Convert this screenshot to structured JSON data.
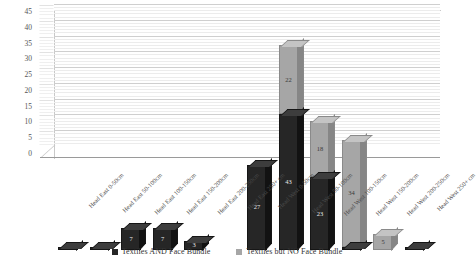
{
  "chart_data": {
    "type": "bar",
    "subtype": "stacked-column-3d",
    "title": "",
    "xlabel": "",
    "ylabel": "",
    "ylim": [
      0,
      45
    ],
    "ytick_step": 5,
    "yticks": [
      "0",
      "5",
      "10",
      "15",
      "20",
      "25",
      "30",
      "35",
      "40",
      "45"
    ],
    "grid": true,
    "legend_position": "bottom",
    "categories": [
      "Head East 0-50cm",
      "Head East 50-100cm",
      "Head East 100-150cm",
      "Head East 150-200cm",
      "Head East 200-250cm",
      "Head East 250+ cm",
      "Head West 0-50cm",
      "Head West 50-100cm",
      "Head West 100-150cm",
      "Head West 150-200cm",
      "Head West 200-250cm",
      "Head West 250+ cm"
    ],
    "series": [
      {
        "name": "Textiles AND Face Bundle",
        "color": "#262626",
        "values": [
          1,
          1,
          7,
          7,
          3,
          0,
          27,
          43,
          23,
          1,
          0,
          1
        ]
      },
      {
        "name": "Textiles but NO Face Bundle",
        "color": "#a6a6a6",
        "values": [
          0,
          0,
          0,
          0,
          0,
          0,
          0,
          22,
          18,
          34,
          5,
          0
        ]
      }
    ],
    "bar_labels": [
      {
        "dark": "1",
        "light": ""
      },
      {
        "dark": "1",
        "light": ""
      },
      {
        "dark": "7",
        "light": ""
      },
      {
        "dark": "7",
        "light": "0"
      },
      {
        "dark": "3",
        "light": "0"
      },
      {
        "dark": "",
        "light": ""
      },
      {
        "dark": "27",
        "light": ""
      },
      {
        "dark": "43",
        "light": "22"
      },
      {
        "dark": "23",
        "light": "18"
      },
      {
        "dark": "1",
        "light": "34"
      },
      {
        "dark": "",
        "light": "5"
      },
      {
        "dark": "1",
        "light": ""
      }
    ]
  },
  "legend": {
    "items": [
      {
        "label": "Textiles AND Face Bundle",
        "color": "#262626"
      },
      {
        "label": "Textiles but NO Face Bundle",
        "color": "#a6a6a6"
      }
    ]
  }
}
